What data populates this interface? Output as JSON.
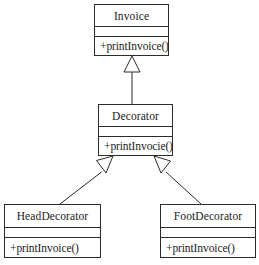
{
  "diagram": {
    "kind": "uml-class-diagram",
    "pattern": "Decorator",
    "background_color": "#ffffff",
    "line_color": "#2b2b2b",
    "classes": [
      {
        "id": "invoice",
        "name": "Invoice",
        "attributes": [],
        "operations": [
          "+printInvoice()"
        ]
      },
      {
        "id": "decorator",
        "name": "Decorator",
        "attributes": [],
        "operations": [
          "+printInvocie()"
        ]
      },
      {
        "id": "headdecorator",
        "name": "HeadDecorator",
        "attributes": [],
        "operations": [
          "+printInvoice()"
        ]
      },
      {
        "id": "footdecorator",
        "name": "FootDecorator",
        "attributes": [],
        "operations": [
          "+printInvoice()"
        ]
      }
    ],
    "relationships": [
      {
        "id": "decorator-to-invoice",
        "type": "generalization",
        "arrow": "hollow-triangle",
        "from": "Decorator",
        "to": "Invoice"
      },
      {
        "id": "headdecorator-to-decorator",
        "type": "generalization",
        "arrow": "hollow-triangle",
        "from": "HeadDecorator",
        "to": "Decorator"
      },
      {
        "id": "footdecorator-to-decorator",
        "type": "generalization",
        "arrow": "hollow-triangle",
        "from": "FootDecorator",
        "to": "Decorator"
      }
    ]
  }
}
